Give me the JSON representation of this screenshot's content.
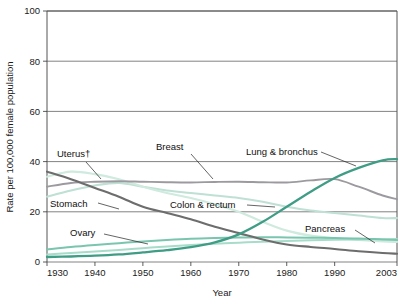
{
  "chart_data": {
    "type": "line",
    "title": "",
    "xlabel": "Year",
    "ylabel": "Rate per 100,000 female population",
    "xlim": [
      1930,
      2003
    ],
    "ylim": [
      0,
      100
    ],
    "yticks": [
      0,
      20,
      40,
      60,
      80,
      100
    ],
    "ytick_labels": [
      "0",
      "20",
      "40",
      "60",
      "80",
      "100"
    ],
    "xticks": [
      1930,
      1940,
      1950,
      1960,
      1970,
      1980,
      1990,
      2003
    ],
    "xtick_labels": [
      "1930",
      "1940",
      "1950",
      "1960",
      "1970",
      "1980",
      "1990",
      "2003"
    ],
    "grid": true,
    "grid_axis": "y",
    "legend_position": "inline-annotations",
    "x": [
      1930,
      1935,
      1940,
      1945,
      1950,
      1955,
      1960,
      1965,
      1970,
      1975,
      1980,
      1985,
      1990,
      1995,
      2000,
      2003
    ],
    "series": [
      {
        "name": "Lung & bronchus",
        "color": "#3f9c85",
        "width": 2.3,
        "values": [
          2.0,
          2.2,
          2.5,
          3.0,
          3.8,
          4.7,
          5.9,
          7.8,
          11.0,
          16.0,
          22.0,
          28.0,
          33.5,
          37.5,
          40.5,
          41.0
        ]
      },
      {
        "name": "Breast",
        "color": "#9d9a9f",
        "width": 1.9,
        "values": [
          30.0,
          31.5,
          32.0,
          32.2,
          32.0,
          31.8,
          31.7,
          31.9,
          32.0,
          31.8,
          31.7,
          32.5,
          33.0,
          30.0,
          26.5,
          25.0
        ]
      },
      {
        "name": "Colon & rectum",
        "color": "#bfe0d4",
        "width": 2.1,
        "values": [
          26.0,
          28.5,
          30.5,
          31.5,
          30.0,
          28.5,
          27.5,
          26.5,
          25.5,
          24.0,
          22.0,
          20.5,
          19.5,
          18.5,
          17.5,
          17.5
        ]
      },
      {
        "name": "Stomach",
        "color": "#6d6d6d",
        "width": 2.1,
        "values": [
          36.0,
          33.0,
          29.5,
          26.0,
          22.0,
          19.5,
          17.0,
          14.0,
          11.5,
          9.0,
          7.0,
          6.0,
          5.2,
          4.3,
          3.6,
          3.3
        ]
      },
      {
        "name": "Uterus",
        "label": "Uterus†",
        "color": "#cfeade",
        "width": 2.1,
        "values": [
          34.0,
          36.0,
          35.0,
          33.0,
          30.0,
          27.5,
          25.5,
          23.0,
          20.0,
          16.0,
          12.5,
          10.5,
          9.5,
          8.8,
          8.2,
          8.0
        ]
      },
      {
        "name": "Ovary",
        "color": "#79c5ae",
        "width": 2.0,
        "values": [
          5.0,
          6.0,
          6.8,
          7.5,
          8.2,
          8.8,
          9.3,
          9.6,
          9.8,
          9.9,
          9.8,
          9.7,
          9.6,
          9.4,
          9.0,
          8.8
        ]
      },
      {
        "name": "Pancreas",
        "color": "#a8dcca",
        "width": 2.0,
        "values": [
          3.0,
          3.6,
          4.2,
          4.8,
          5.5,
          6.2,
          6.8,
          7.3,
          7.7,
          8.1,
          8.4,
          8.7,
          8.9,
          9.0,
          9.1,
          9.2
        ]
      }
    ],
    "annotations": [
      {
        "name": "uterus-label",
        "text": "Uterus†",
        "x": 57,
        "y": 157,
        "leader": [
          [
            86,
            162
          ],
          [
            101,
            179
          ]
        ]
      },
      {
        "name": "breast-label",
        "text": "Breast",
        "x": 156,
        "y": 150,
        "leader": [
          [
            191,
            154
          ],
          [
            213,
            179
          ]
        ]
      },
      {
        "name": "lung-label",
        "text": "Lung & bronchus",
        "x": 246,
        "y": 155,
        "leader": [
          [
            321,
            152
          ],
          [
            356,
            166
          ]
        ]
      },
      {
        "name": "stomach-label",
        "text": "Stomach",
        "x": 50,
        "y": 207,
        "leader": [
          [
            98,
            203
          ],
          [
            119,
            209
          ]
        ]
      },
      {
        "name": "colon-label",
        "text": "Colon & rectum",
        "x": 170,
        "y": 208,
        "leader": [
          [
            247,
            205
          ],
          [
            275,
            207
          ]
        ]
      },
      {
        "name": "ovary-label",
        "text": "Ovary",
        "x": 70,
        "y": 236,
        "leader": [
          [
            104,
            234
          ],
          [
            148,
            244
          ]
        ]
      },
      {
        "name": "pancreas-label",
        "text": "Pancreas",
        "x": 305,
        "y": 232,
        "leader": [
          [
            355,
            230
          ],
          [
            375,
            243
          ]
        ]
      }
    ]
  }
}
